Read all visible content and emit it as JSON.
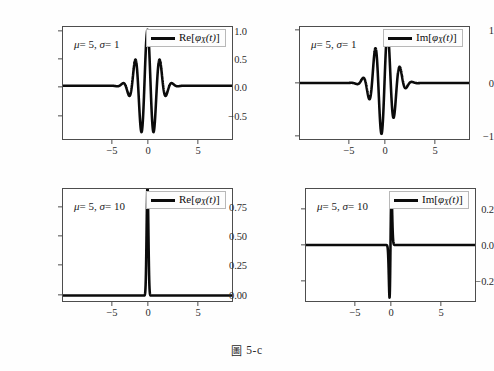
{
  "figure": {
    "caption_mark": "圖",
    "caption_text": "5-c",
    "background": "#fefefe",
    "line_color": "#0b0b0b",
    "frame_color": "#4d4d4d"
  },
  "panels": [
    {
      "id": "top-left",
      "annotation": {
        "mu_label": "μ",
        "mu_value": "= 5,",
        "sigma_label": "σ",
        "sigma_value": "= 1"
      },
      "legend": {
        "label_prefix": "Re[",
        "phi": "φ",
        "subscript": "X",
        "arg": "(t)",
        "label_suffix": "]"
      },
      "yticks": [
        "1.0",
        "0.5",
        "0.0",
        "−0.5"
      ],
      "ytick_values": [
        1.0,
        0.5,
        0.0,
        -0.5
      ],
      "xticks": [
        "−5",
        "0",
        "5"
      ],
      "xtick_values": [
        -5,
        0,
        5
      ]
    },
    {
      "id": "top-right",
      "annotation": {
        "mu_label": "μ",
        "mu_value": "= 5,",
        "sigma_label": "σ",
        "sigma_value": "= 1"
      },
      "legend": {
        "label_prefix": "Im[",
        "phi": "φ",
        "subscript": "X",
        "arg": "(t)",
        "label_suffix": "]"
      },
      "yticks": [
        "1",
        "0",
        "−1"
      ],
      "ytick_values": [
        1,
        0,
        -1
      ],
      "xticks": [
        "−5",
        "0",
        "5"
      ],
      "xtick_values": [
        -5,
        0,
        5
      ]
    },
    {
      "id": "bottom-left",
      "annotation": {
        "mu_label": "μ",
        "mu_value": "= 5,",
        "sigma_label": "σ",
        "sigma_value": "= 10"
      },
      "legend": {
        "label_prefix": "Re[",
        "phi": "φ",
        "subscript": "X",
        "arg": "(t)",
        "label_suffix": "]"
      },
      "yticks": [
        "0.75",
        "0.50",
        "0.25",
        "0.00"
      ],
      "ytick_values": [
        0.75,
        0.5,
        0.25,
        0.0
      ],
      "xticks": [
        "−5",
        "0",
        "5"
      ],
      "xtick_values": [
        -5,
        0,
        5
      ]
    },
    {
      "id": "bottom-right",
      "annotation": {
        "mu_label": "μ",
        "mu_value": "= 5,",
        "sigma_label": "σ",
        "sigma_value": "= 10"
      },
      "legend": {
        "label_prefix": "Im[",
        "phi": "φ",
        "subscript": "X",
        "arg": "(t)",
        "label_suffix": "]"
      },
      "yticks": [
        "0.2",
        "0.0",
        "−0.2"
      ],
      "ytick_values": [
        0.2,
        0.0,
        -0.2
      ],
      "xticks": [
        "−5",
        "0",
        "5"
      ],
      "xtick_values": [
        -5,
        0,
        5
      ]
    }
  ],
  "chart_data": [
    {
      "type": "line",
      "id": "top-left",
      "title": "",
      "xlabel": "",
      "ylabel": "",
      "legend": "Re[φ_X(t)]",
      "annotation": "μ = 5, σ = 1",
      "formula": "exp(-sigma^2 t^2 / 2) * cos(mu t)",
      "mu": 5,
      "sigma": 1,
      "xlim": [
        -8.5,
        8.5
      ],
      "ylim": [
        -0.95,
        1.05
      ],
      "xticks": [
        -5,
        0,
        5
      ],
      "yticks": [
        1.0,
        0.5,
        0.0,
        -0.5
      ],
      "grid": false,
      "legend_position": "upper right",
      "x": [
        -8.5,
        -8.0,
        -7.5,
        -7.0,
        -6.5,
        -6.0,
        -5.5,
        -5.0,
        -4.5,
        -4.0,
        -3.5,
        -3.2,
        -3.0,
        -2.8,
        -2.6,
        -2.4,
        -2.2,
        -2.0,
        -1.8,
        -1.6,
        -1.4,
        -1.2,
        -1.0,
        -0.8,
        -0.6,
        -0.4,
        -0.2,
        0.0,
        0.2,
        0.4,
        0.6,
        0.8,
        1.0,
        1.2,
        1.4,
        1.6,
        1.8,
        2.0,
        2.2,
        2.4,
        2.6,
        2.8,
        3.0,
        3.2,
        3.5,
        4.0,
        4.5,
        5.0,
        5.5,
        6.0,
        6.5,
        7.0,
        7.5,
        8.0,
        8.5
      ],
      "y": [
        0.0,
        0.0,
        0.0,
        0.0,
        0.0,
        0.0,
        0.0,
        0.0,
        0.0,
        0.0,
        0.002,
        0.005,
        -0.008,
        -0.019,
        -0.025,
        -0.01,
        0.03,
        0.08,
        0.09,
        0.0,
        -0.18,
        -0.34,
        -0.33,
        -0.05,
        0.41,
        0.77,
        0.86,
        1.0,
        0.86,
        0.77,
        0.41,
        -0.05,
        -0.33,
        -0.34,
        -0.18,
        0.0,
        0.09,
        0.08,
        0.03,
        -0.01,
        -0.025,
        -0.019,
        -0.008,
        0.005,
        0.002,
        0.0,
        0.0,
        0.0,
        0.0,
        0.0,
        0.0,
        0.0,
        0.0,
        0.0,
        0.0
      ]
    },
    {
      "type": "line",
      "id": "top-right",
      "title": "",
      "xlabel": "",
      "ylabel": "",
      "legend": "Im[φ_X(t)]",
      "annotation": "μ = 5, σ = 1",
      "formula": "exp(-sigma^2 t^2 / 2) * sin(mu t)",
      "mu": 5,
      "sigma": 1,
      "xlim": [
        -8.5,
        8.5
      ],
      "ylim": [
        -1.05,
        1.05
      ],
      "xticks": [
        -5,
        0,
        5
      ],
      "yticks": [
        1,
        0,
        -1
      ],
      "grid": false,
      "legend_position": "upper right",
      "x": [
        -8.5,
        -8.0,
        -7.0,
        -6.0,
        -5.0,
        -4.0,
        -3.5,
        -3.2,
        -3.0,
        -2.8,
        -2.6,
        -2.4,
        -2.2,
        -2.0,
        -1.8,
        -1.6,
        -1.4,
        -1.2,
        -1.0,
        -0.8,
        -0.6,
        -0.4,
        -0.2,
        0.0,
        0.2,
        0.4,
        0.6,
        0.8,
        1.0,
        1.2,
        1.4,
        1.6,
        1.8,
        2.0,
        2.2,
        2.4,
        2.6,
        2.8,
        3.0,
        3.2,
        3.5,
        4.0,
        5.0,
        6.0,
        7.0,
        8.0,
        8.5
      ],
      "y": [
        0.0,
        0.0,
        0.0,
        0.0,
        0.0,
        0.0,
        -0.002,
        -0.006,
        -0.004,
        0.006,
        0.018,
        0.028,
        0.02,
        -0.02,
        -0.1,
        -0.2,
        -0.25,
        -0.13,
        0.2,
        0.6,
        0.72,
        0.45,
        -0.32,
        0.0,
        0.32,
        -0.45,
        -0.72,
        -0.6,
        -0.2,
        0.13,
        0.25,
        0.2,
        0.1,
        0.02,
        -0.02,
        -0.028,
        -0.018,
        -0.006,
        0.004,
        0.006,
        0.002,
        0.0,
        0.0,
        0.0,
        0.0,
        0.0,
        0.0
      ]
    },
    {
      "type": "line",
      "id": "bottom-left",
      "title": "",
      "xlabel": "",
      "ylabel": "",
      "legend": "Re[φ_X(t)]",
      "annotation": "μ = 5, σ = 10",
      "formula": "exp(-sigma^2 t^2 / 2) * cos(mu t)",
      "mu": 5,
      "sigma": 10,
      "xlim": [
        -8.5,
        8.5
      ],
      "ylim": [
        -0.05,
        0.97
      ],
      "xticks": [
        -5,
        0,
        5
      ],
      "yticks": [
        0.75,
        0.5,
        0.25,
        0.0
      ],
      "grid": false,
      "legend_position": "upper right",
      "x": [
        -8.5,
        -6.0,
        -4.0,
        -2.0,
        -1.0,
        -0.5,
        -0.3,
        -0.2,
        -0.12,
        -0.06,
        -0.03,
        0.0,
        0.03,
        0.06,
        0.12,
        0.2,
        0.3,
        0.5,
        1.0,
        2.0,
        4.0,
        6.0,
        8.5
      ],
      "y": [
        0.0,
        0.0,
        0.0,
        0.0,
        0.0,
        0.0,
        0.0,
        0.005,
        0.12,
        0.57,
        0.84,
        0.92,
        0.84,
        0.57,
        0.12,
        0.005,
        0.0,
        0.0,
        0.0,
        0.0,
        0.0,
        0.0,
        0.0
      ]
    },
    {
      "type": "line",
      "id": "bottom-right",
      "title": "",
      "xlabel": "",
      "ylabel": "",
      "legend": "Im[φ_X(t)]",
      "annotation": "μ = 5, σ = 10",
      "formula": "exp(-sigma^2 t^2 / 2) * sin(mu t)",
      "mu": 5,
      "sigma": 10,
      "xlim": [
        -8.5,
        8.5
      ],
      "ylim": [
        -0.31,
        0.31
      ],
      "xticks": [
        -5,
        0,
        5
      ],
      "yticks": [
        0.2,
        0.0,
        -0.2
      ],
      "grid": false,
      "legend_position": "upper right",
      "x": [
        -8.5,
        -6.0,
        -4.0,
        -2.0,
        -1.0,
        -0.5,
        -0.25,
        -0.14,
        -0.1,
        -0.06,
        -0.03,
        0.0,
        0.03,
        0.06,
        0.1,
        0.14,
        0.25,
        0.5,
        1.0,
        2.0,
        4.0,
        6.0,
        8.5
      ],
      "y": [
        0.0,
        0.0,
        0.0,
        0.0,
        0.0,
        0.0,
        0.0,
        -0.03,
        -0.15,
        -0.28,
        -0.18,
        0.0,
        0.18,
        0.28,
        0.15,
        0.03,
        0.0,
        0.0,
        0.0,
        0.0,
        0.0,
        0.0,
        0.0
      ]
    }
  ]
}
